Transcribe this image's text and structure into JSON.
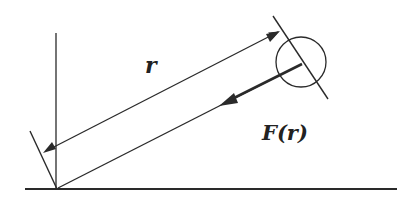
{
  "diagram": {
    "type": "physics-diagram",
    "labels": {
      "distance": "r",
      "force": "F(r)"
    },
    "colors": {
      "stroke": "#2a2a2a",
      "background": "#ffffff"
    },
    "elements": {
      "ground_line": {
        "x1": 25,
        "y1": 189,
        "x2": 397,
        "y2": 189
      },
      "vertical_axis": {
        "x1": 56,
        "y1": 33,
        "x2": 56,
        "y2": 189
      },
      "rod": {
        "x1": 58,
        "y1": 188,
        "x2": 302,
        "y2": 64
      },
      "dimension_line_r": {
        "x1": 43,
        "y1": 152,
        "x2": 278,
        "y2": 32
      },
      "mass_circle": {
        "cx": 301,
        "cy": 62,
        "r": 25
      },
      "force_arrow": {
        "from_x": 301,
        "from_y": 63,
        "to_x": 222,
        "to_y": 104
      }
    }
  }
}
